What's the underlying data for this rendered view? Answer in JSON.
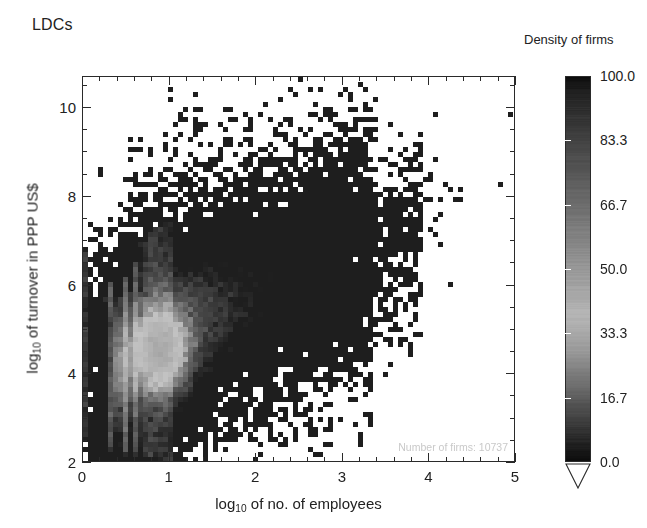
{
  "figure": {
    "title": "LDCs",
    "annotation_prefix": "Number of firms:",
    "annotation_value": "10737",
    "annotation_full": "Number of firms:  10737"
  },
  "axes": {
    "x": {
      "title_pre": "log",
      "title_sub": "10",
      "title_post": " of no. of employees",
      "title_full": "log10 of no. of employees",
      "ticks": [
        "0",
        "1",
        "2",
        "3",
        "4",
        "5"
      ],
      "range": [
        0,
        5
      ],
      "minor_per_major": 5
    },
    "y": {
      "title_pre": "log",
      "title_sub": "10",
      "title_post": " of turnover in PPP US$",
      "title_full": "log10 of turnover in PPP US$",
      "ticks": [
        "2",
        "4",
        "6",
        "8",
        "10"
      ],
      "range": [
        2,
        10.7
      ],
      "minor_per_major": 4
    }
  },
  "colorbar": {
    "title": "Density of firms",
    "ticks": [
      "100.0",
      "83.3",
      "66.7",
      "50.0",
      "33.3",
      "16.7",
      "0.0"
    ],
    "range": [
      0.0,
      100.0
    ],
    "orientation": "vertical",
    "has_under_arrow": true
  },
  "colors": {
    "ink": "#1a1a1a",
    "frame": "#2a2a2a",
    "annotation": "#c9c9c9",
    "background": "#ffffff",
    "cmap_dark": "#0d0d0d",
    "cmap_light": "#e8e8e8"
  },
  "chart_data": {
    "type": "heatmap",
    "title": "LDCs",
    "xlabel": "log10 of no. of employees",
    "ylabel": "log10 of turnover in PPP US$",
    "xlim": [
      0,
      5
    ],
    "ylim": [
      2,
      10.7
    ],
    "zlabel": "Density of firms",
    "zlim": [
      0,
      100
    ],
    "grid": false,
    "legend": "none",
    "n_points": 10737,
    "bin_size": [
      0.0385,
      0.0725
    ],
    "colormap": "grayscale-inverted",
    "cluster_core": {
      "x": 0.92,
      "y": 4.55,
      "peak_density": 100
    },
    "ridge_slope": 1.0,
    "ridge_intercept": 3.6,
    "stripes_x": [
      0.0,
      0.301,
      0.477,
      0.602,
      0.699,
      0.778,
      0.845,
      0.903,
      0.954,
      1.0
    ],
    "stripe_y_ranges": [
      [
        2.6,
        6.8
      ],
      [
        2.3,
        6.1
      ],
      [
        2.2,
        6.2
      ],
      [
        2.2,
        6.5
      ],
      [
        2.1,
        7.0
      ],
      [
        2.1,
        7.2
      ],
      [
        2.1,
        7.3
      ],
      [
        2.0,
        7.4
      ],
      [
        2.0,
        7.4
      ],
      [
        2.0,
        7.5
      ]
    ],
    "x_marginal": {
      "bins": [
        0.1,
        0.3,
        0.5,
        0.7,
        0.9,
        1.1,
        1.3,
        1.5,
        1.7,
        1.9,
        2.1,
        2.3,
        2.5,
        2.7,
        2.9,
        3.1,
        3.3,
        3.5,
        3.7,
        3.9,
        4.1
      ],
      "counts": [
        420,
        760,
        880,
        1320,
        1510,
        1180,
        890,
        700,
        560,
        470,
        390,
        320,
        260,
        205,
        160,
        120,
        85,
        55,
        30,
        14,
        5
      ]
    },
    "y_marginal": {
      "bins": [
        2.2,
        2.6,
        3.0,
        3.4,
        3.8,
        4.2,
        4.6,
        5.0,
        5.4,
        5.8,
        6.2,
        6.6,
        7.0,
        7.4,
        7.8,
        8.2,
        8.6,
        9.0,
        9.4
      ],
      "counts": [
        120,
        260,
        520,
        840,
        1180,
        1420,
        1350,
        1120,
        930,
        780,
        640,
        500,
        360,
        230,
        130,
        70,
        32,
        14,
        5
      ]
    }
  }
}
